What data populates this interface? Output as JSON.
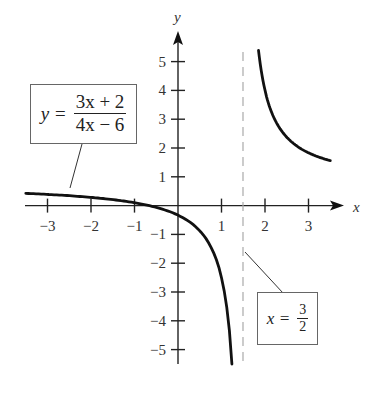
{
  "chart_data": {
    "type": "line",
    "title": "",
    "xlabel": "x",
    "ylabel": "y",
    "xlim": [
      -3.5,
      3.7
    ],
    "ylim": [
      -5.5,
      5.5
    ],
    "grid": false,
    "x_ticks": [
      -3,
      -2,
      -1,
      1,
      2,
      3
    ],
    "x_tick_labels": [
      "−3",
      "−2",
      "−1",
      "1",
      "2",
      "3"
    ],
    "y_ticks": [
      5,
      4,
      3,
      2,
      1,
      -1,
      -2,
      -3,
      -4,
      -5
    ],
    "y_tick_labels": [
      "5",
      "4",
      "3",
      "2",
      "1",
      "−1",
      "−2",
      "−3",
      "−4",
      "−5"
    ],
    "function": "y = (3x + 2) / (4x - 6)",
    "vertical_asymptote": 1.5,
    "series": [
      {
        "name": "left branch",
        "x": [
          -3.5,
          -3,
          -2.5,
          -2,
          -1.5,
          -1,
          -0.5,
          0,
          0.25,
          0.5,
          0.75,
          0.9,
          1.0,
          1.1,
          1.15,
          1.2,
          1.24
        ],
        "y": [
          0.425,
          0.389,
          0.344,
          0.286,
          0.208,
          0.1,
          -0.0625,
          -0.333,
          -0.55,
          -0.875,
          -1.417,
          -1.958,
          -2.5,
          -3.31,
          -3.89,
          -4.67,
          -5.5
        ]
      },
      {
        "name": "right branch",
        "x": [
          1.85,
          1.9,
          2.0,
          2.1,
          2.25,
          2.5,
          2.75,
          3.0,
          3.25,
          3.5
        ],
        "y": [
          5.39,
          4.81,
          4.0,
          3.46,
          2.92,
          2.375,
          2.05,
          1.833,
          1.679,
          1.5625
        ]
      }
    ],
    "annotations": [
      {
        "text": "y = (3x + 2)/(4x − 6)",
        "target": "curve"
      },
      {
        "text": "x = 3/2",
        "target": "asymptote"
      }
    ]
  },
  "labels": {
    "x_axis": "x",
    "y_axis": "y",
    "fn_lhs": "y =",
    "fn_num": "3x + 2",
    "fn_den": "4x − 6",
    "asym_lhs": "x =",
    "asym_num": "3",
    "asym_den": "2"
  },
  "colors": {
    "curve": "#111111",
    "axis": "#222222",
    "asymptote": "#aaaaaa",
    "box_border": "#666666"
  }
}
